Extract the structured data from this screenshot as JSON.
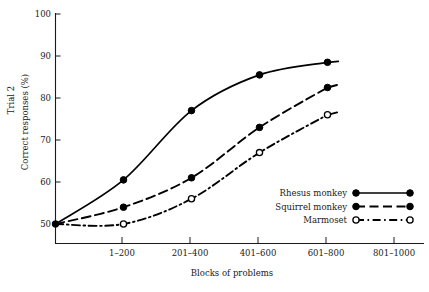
{
  "chart_data": {
    "type": "line",
    "title": "",
    "xlabel": "Blocks of problems",
    "ylabel": "Correct responses (%)",
    "ylabel_secondary": "Trial 2",
    "categories": [
      "1–200",
      "201–400",
      "401–600",
      "601–800",
      "801–1000"
    ],
    "xlim": [
      0,
      5.5
    ],
    "ylim": [
      50,
      100
    ],
    "yticks": [
      50,
      60,
      70,
      80,
      90,
      100
    ],
    "ytick_labels": [
      "50",
      "60",
      "70",
      "80",
      "90",
      "100"
    ],
    "grid": false,
    "legend_position": "lower right",
    "origin_value": 50,
    "series": [
      {
        "name": "Rhesus monkey",
        "marker": "filled-circle",
        "linestyle": "solid",
        "x": [
          0,
          1,
          2,
          3,
          4
        ],
        "x_positions": [
          0,
          1,
          2,
          3,
          4
        ],
        "values": [
          50,
          60.5,
          77,
          85.5,
          88.5
        ],
        "point_labels": [
          "50",
          "60.5",
          "77",
          "85.5",
          "88.5"
        ]
      },
      {
        "name": "Squirrel monkey",
        "marker": "filled-circle",
        "linestyle": "dashed",
        "x": [
          0,
          1,
          2,
          3,
          4
        ],
        "x_positions": [
          0,
          1,
          2,
          3,
          4
        ],
        "values": [
          50,
          54,
          61,
          73,
          82.5
        ],
        "point_labels": [
          "50",
          "54",
          "61",
          "73",
          "82.5"
        ]
      },
      {
        "name": "Marmoset",
        "marker": "open-circle",
        "linestyle": "dash-dot",
        "x": [
          0,
          1,
          2,
          3,
          4
        ],
        "x_positions": [
          0,
          1,
          2,
          3,
          4
        ],
        "values": [
          50,
          50,
          56,
          67,
          76
        ],
        "point_labels": [
          "50",
          "50",
          "56",
          "67",
          "76"
        ]
      }
    ]
  },
  "axes": {
    "y": {
      "title_primary": "Trial 2",
      "title_secondary": "Correct responses (%)",
      "ticks": [
        {
          "label": "100"
        },
        {
          "label": "90"
        },
        {
          "label": "80"
        },
        {
          "label": "70"
        },
        {
          "label": "60"
        },
        {
          "label": "50"
        }
      ]
    },
    "x": {
      "title": "Blocks of problems",
      "ticks": [
        {
          "label": "1–200"
        },
        {
          "label": "201–400"
        },
        {
          "label": "401–600"
        },
        {
          "label": "601–800"
        },
        {
          "label": "801–1000"
        }
      ]
    }
  },
  "legend": {
    "entries": [
      {
        "label": "Rhesus monkey",
        "marker": "filled-circle",
        "linestyle": "solid"
      },
      {
        "label": "Squirrel monkey",
        "marker": "filled-circle",
        "linestyle": "dashed"
      },
      {
        "label": "Marmoset",
        "marker": "open-circle",
        "linestyle": "dash-dot"
      }
    ]
  },
  "colors": {
    "ink": "#1a1a1a",
    "line": "#000000",
    "background": "#ffffff"
  }
}
